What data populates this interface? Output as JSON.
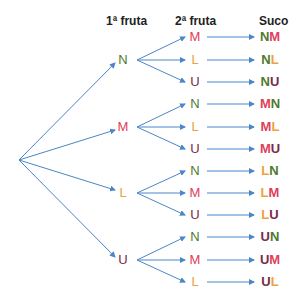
{
  "headers": {
    "first": "1ª fruta",
    "second": "2ª fruta",
    "result": "Suco"
  },
  "colors": {
    "N": "#4f7a2e",
    "M": "#e0405a",
    "L": "#f0a040",
    "U": "#7a2a4a",
    "arrow": "#4a86c8"
  },
  "root": {
    "x": 19,
    "y": 160
  },
  "branches": [
    {
      "fruit": "N",
      "y": 60,
      "children": [
        {
          "fruit": "M",
          "y": 37,
          "suco": [
            "N",
            "M"
          ]
        },
        {
          "fruit": "L",
          "y": 60,
          "suco": [
            "N",
            "L"
          ]
        },
        {
          "fruit": "U",
          "y": 82,
          "suco": [
            "N",
            "U"
          ]
        }
      ]
    },
    {
      "fruit": "M",
      "y": 127,
      "children": [
        {
          "fruit": "N",
          "y": 104,
          "suco": [
            "M",
            "N"
          ]
        },
        {
          "fruit": "L",
          "y": 127,
          "suco": [
            "M",
            "L"
          ]
        },
        {
          "fruit": "U",
          "y": 149,
          "suco": [
            "M",
            "U"
          ]
        }
      ]
    },
    {
      "fruit": "L",
      "y": 193,
      "children": [
        {
          "fruit": "N",
          "y": 171,
          "suco": [
            "L",
            "N"
          ]
        },
        {
          "fruit": "M",
          "y": 193,
          "suco": [
            "L",
            "M"
          ]
        },
        {
          "fruit": "U",
          "y": 215,
          "suco": [
            "L",
            "U"
          ]
        }
      ]
    },
    {
      "fruit": "U",
      "y": 260,
      "children": [
        {
          "fruit": "N",
          "y": 237,
          "suco": [
            "U",
            "N"
          ]
        },
        {
          "fruit": "M",
          "y": 260,
          "suco": [
            "U",
            "M"
          ]
        },
        {
          "fruit": "L",
          "y": 282,
          "suco": [
            "U",
            "L"
          ]
        }
      ]
    }
  ]
}
